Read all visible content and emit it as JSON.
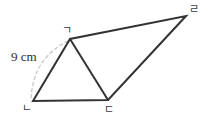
{
  "figure": {
    "type": "quadrilateral-with-diagonal",
    "background_color": "#ffffff",
    "stroke_color": "#333333",
    "arc_color": "#cccccc",
    "vertices": [
      {
        "id": "a",
        "label": "ㄱ",
        "x": 70,
        "y": 39
      },
      {
        "id": "d",
        "label": "ㄹ",
        "x": 186,
        "y": 16
      },
      {
        "id": "b",
        "label": "ㄴ",
        "x": 33,
        "y": 101
      },
      {
        "id": "c",
        "label": "ㄷ",
        "x": 108,
        "y": 100
      }
    ],
    "edges": [
      {
        "from": "b",
        "to": "a",
        "style": "solid"
      },
      {
        "from": "a",
        "to": "d",
        "style": "solid"
      },
      {
        "from": "d",
        "to": "c",
        "style": "solid"
      },
      {
        "from": "c",
        "to": "b",
        "style": "solid"
      },
      {
        "from": "a",
        "to": "c",
        "style": "solid"
      }
    ],
    "measurements": [
      {
        "id": "side-ab",
        "text": "9 cm",
        "applies_to": "ㄴㄱ",
        "guide": "dashed-arc"
      }
    ]
  }
}
